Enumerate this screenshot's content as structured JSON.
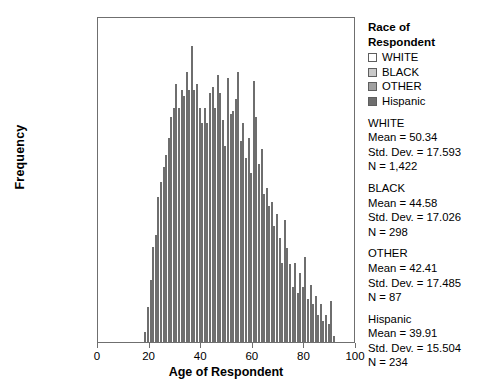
{
  "chart_data": {
    "type": "bar",
    "subtype": "stacked-histogram",
    "title": "",
    "xlabel": "Age of Respondent",
    "ylabel": "Frequency",
    "xlim": [
      0,
      100
    ],
    "ylim": [
      0,
      110
    ],
    "xticks": [
      "0",
      "20",
      "40",
      "60",
      "80",
      "100"
    ],
    "yticks": [
      "0.0",
      "20.0",
      "40.0",
      "60.0",
      "80.0",
      "100.0"
    ],
    "grid": false,
    "legend_position": "right",
    "bin_width": 1,
    "series": [
      {
        "name": "WHITE",
        "color": "#ffffff"
      },
      {
        "name": "BLACK",
        "color": "#c9c9c9"
      },
      {
        "name": "OTHER",
        "color": "#a0a0a0"
      },
      {
        "name": "Hispanic",
        "color": "#6e6e6e"
      }
    ],
    "x": [
      18,
      19,
      20,
      21,
      22,
      23,
      24,
      25,
      26,
      27,
      28,
      29,
      30,
      31,
      32,
      33,
      34,
      35,
      36,
      37,
      38,
      39,
      40,
      41,
      42,
      43,
      44,
      45,
      46,
      47,
      48,
      49,
      50,
      51,
      52,
      53,
      54,
      55,
      56,
      57,
      58,
      59,
      60,
      61,
      62,
      63,
      64,
      65,
      66,
      67,
      68,
      69,
      70,
      71,
      72,
      73,
      74,
      75,
      76,
      77,
      78,
      79,
      80,
      81,
      82,
      83,
      84,
      85,
      86,
      87,
      88,
      89,
      90,
      91
    ],
    "values": {
      "Hispanic": [
        1,
        3,
        4,
        6,
        5,
        8,
        7,
        8,
        6,
        7,
        9,
        8,
        10,
        9,
        8,
        9,
        8,
        7,
        9,
        8,
        10,
        9,
        8,
        7,
        9,
        8,
        7,
        6,
        8,
        7,
        6,
        5,
        6,
        5,
        4,
        5,
        4,
        3,
        4,
        3,
        3,
        2,
        3,
        2,
        2,
        1,
        2,
        1,
        1,
        1,
        1,
        1,
        1,
        0,
        1,
        0,
        1,
        0,
        0,
        0,
        1,
        0,
        0,
        0,
        1,
        0,
        0,
        0,
        0,
        0,
        0,
        0,
        0,
        0
      ],
      "OTHER": [
        0,
        1,
        1,
        1,
        2,
        2,
        2,
        3,
        2,
        3,
        3,
        3,
        4,
        3,
        4,
        3,
        4,
        3,
        4,
        3,
        3,
        3,
        2,
        3,
        2,
        3,
        2,
        2,
        2,
        2,
        2,
        1,
        2,
        1,
        2,
        1,
        1,
        2,
        1,
        1,
        1,
        1,
        1,
        1,
        1,
        1,
        1,
        1,
        1,
        0,
        1,
        0,
        1,
        0,
        0,
        0,
        0,
        0,
        0,
        0,
        0,
        0,
        0,
        0,
        0,
        0,
        0,
        0,
        0,
        0,
        0,
        0,
        0,
        0
      ],
      "BLACK": [
        1,
        2,
        4,
        6,
        5,
        7,
        8,
        7,
        9,
        8,
        10,
        9,
        11,
        10,
        9,
        10,
        8,
        9,
        8,
        7,
        9,
        8,
        7,
        8,
        7,
        6,
        7,
        6,
        7,
        6,
        5,
        6,
        5,
        6,
        5,
        4,
        5,
        4,
        5,
        4,
        4,
        3,
        5,
        4,
        3,
        4,
        3,
        4,
        3,
        3,
        2,
        3,
        2,
        2,
        3,
        2,
        2,
        1,
        2,
        1,
        1,
        1,
        1,
        1,
        1,
        1,
        1,
        0,
        1,
        0,
        0,
        0,
        0,
        0
      ],
      "WHITE": [
        2,
        7,
        13,
        20,
        25,
        33,
        38,
        42,
        47,
        52,
        55,
        60,
        63,
        58,
        65,
        62,
        72,
        67,
        80,
        68,
        66,
        60,
        58,
        62,
        57,
        68,
        71,
        66,
        74,
        70,
        63,
        55,
        77,
        66,
        68,
        73,
        82,
        60,
        65,
        55,
        62,
        52,
        80,
        70,
        55,
        60,
        45,
        47,
        42,
        44,
        36,
        40,
        32,
        25,
        38,
        30,
        24,
        18,
        25,
        16,
        22,
        18,
        28,
        14,
        18,
        12,
        15,
        9,
        12,
        7,
        9,
        6,
        14,
        2
      ]
    }
  },
  "legend": {
    "title_line1": "Race of",
    "title_line2": "Respondent",
    "items": [
      {
        "label": "WHITE",
        "color": "#ffffff"
      },
      {
        "label": "BLACK",
        "color": "#c9c9c9"
      },
      {
        "label": "OTHER",
        "color": "#a0a0a0"
      },
      {
        "label": "Hispanic",
        "color": "#6e6e6e"
      }
    ],
    "stats": [
      {
        "group": "WHITE",
        "mean": "Mean = 50.34",
        "sd": "Std. Dev. = 17.593",
        "n": "N = 1,422"
      },
      {
        "group": "BLACK",
        "mean": "Mean = 44.58",
        "sd": "Std. Dev. = 17.026",
        "n": "N = 298"
      },
      {
        "group": "OTHER",
        "mean": "Mean = 42.41",
        "sd": "Std. Dev. = 17.485",
        "n": "N = 87"
      },
      {
        "group": "Hispanic",
        "mean": "Mean = 39.91",
        "sd": "Std. Dev. = 15.504",
        "n": "N = 234"
      }
    ]
  }
}
